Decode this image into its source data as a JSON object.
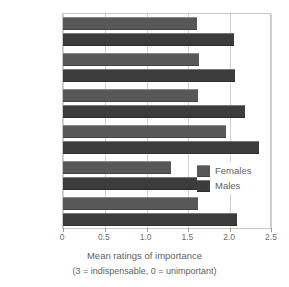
{
  "chart_data": {
    "type": "bar",
    "orientation": "horizontal",
    "title": "",
    "xlabel": "Mean ratings of importance",
    "xlabel_note": "(3 = indispensable, 0 = unimportant)",
    "ylabel": "",
    "xlim": [
      0,
      2.5
    ],
    "xticks": [
      0,
      0.5,
      1.0,
      1.5,
      2.0,
      2.5
    ],
    "xtick_labels": [
      "0",
      "0.5",
      "1.0",
      "1.5",
      "2.0",
      "2.5"
    ],
    "grid": true,
    "grid_axis": "x",
    "legend_position": "center-right",
    "categories": [
      "China",
      "Iran",
      "Zambia",
      "Bulgaria",
      "Venezuela",
      "USA"
    ],
    "series": [
      {
        "name": "Females",
        "color": "#585858",
        "values": [
          1.6,
          1.63,
          1.61,
          1.95,
          1.29,
          1.61
        ]
      },
      {
        "name": "Males",
        "color": "#3c3c3c",
        "values": [
          2.04,
          2.06,
          2.18,
          2.35,
          1.78,
          2.08
        ]
      }
    ]
  },
  "legend": {
    "items": [
      {
        "label": "Females"
      },
      {
        "label": "Males"
      }
    ]
  },
  "colors": {
    "females": "#585858",
    "males": "#3c3c3c",
    "grid": "#d2d2d2",
    "frame": "#c8c8c8",
    "text": "#5f5f5f",
    "background": "#ffffff"
  }
}
